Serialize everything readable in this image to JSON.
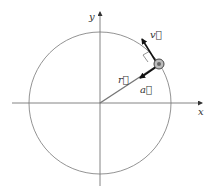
{
  "diagram": {
    "type": "uniform-circular-motion",
    "axes": {
      "x_label": "x",
      "y_label": "y"
    },
    "vectors": {
      "position": "r⃗",
      "velocity": "v⃗",
      "acceleration": "a⃗"
    },
    "colors": {
      "lines": "#555555",
      "vectors": "#111111",
      "particle": "#888888"
    }
  }
}
